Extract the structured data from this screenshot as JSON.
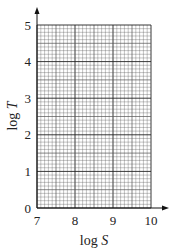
{
  "chart_data": {
    "type": "scatter",
    "title": "",
    "xlabel_prefix": "log ",
    "xlabel_var": "S",
    "ylabel_prefix": "log ",
    "ylabel_var": "T",
    "xlim": [
      7,
      10
    ],
    "ylim": [
      0,
      5
    ],
    "x_ticks": [
      "7",
      "8",
      "9",
      "10"
    ],
    "y_ticks": [
      "0",
      "1",
      "2",
      "3",
      "4",
      "5"
    ],
    "grid": true,
    "minor_divisions_per_unit": 10,
    "series": []
  },
  "colors": {
    "grid_minor": "#555555",
    "grid_major": "#222222",
    "axis": "#111111"
  }
}
